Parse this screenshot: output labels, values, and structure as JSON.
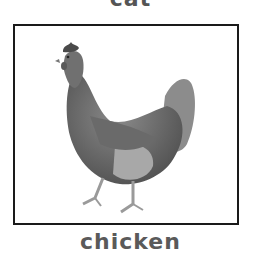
{
  "card": {
    "previous_label": "cat",
    "label": "chicken",
    "image_alt": "chicken",
    "colors": {
      "frame": "#1a1a1a",
      "text": "#5a5a5a",
      "background": "#ffffff"
    }
  }
}
